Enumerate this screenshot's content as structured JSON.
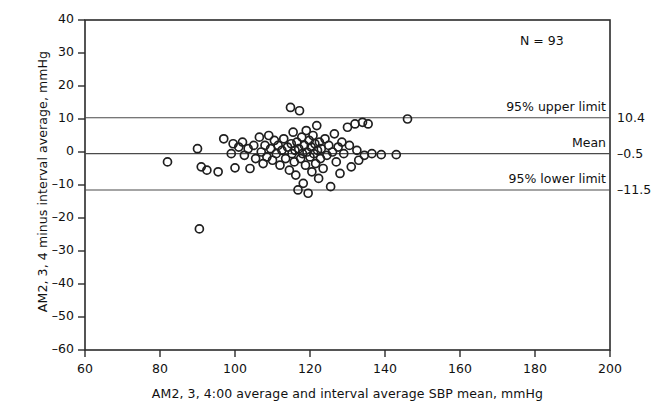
{
  "chart_data": {
    "type": "scatter",
    "title": "",
    "xlabel": "AM2, 3, 4:00 average and interval average SBP mean, mmHg",
    "ylabel": "AM2, 3, 4 minus interval average, mmHg",
    "xlim": [
      60,
      200
    ],
    "ylim": [
      -60,
      40
    ],
    "xticks": [
      60,
      80,
      100,
      120,
      140,
      160,
      180,
      200
    ],
    "yticks": [
      40,
      30,
      20,
      10,
      0,
      -10,
      -20,
      -30,
      -40,
      -50,
      -60
    ],
    "ytick_labels": [
      "40",
      "30",
      "20",
      "10",
      "0",
      "–10",
      "–20",
      "–30",
      "–40",
      "–50",
      "–60"
    ],
    "xtick_labels": [
      "60",
      "80",
      "100",
      "120",
      "140",
      "160",
      "180",
      "200"
    ],
    "grid": false,
    "legend_position": "none",
    "annotations": [
      {
        "name": "sample-size",
        "text": "N = 93"
      }
    ],
    "reference_lines": [
      {
        "name": "95% upper limit",
        "label": "95% upper limit",
        "value": 10.4,
        "value_label": "10.4"
      },
      {
        "name": "Mean",
        "label": "Mean",
        "value": -0.5,
        "value_label": "–0.5"
      },
      {
        "name": "95% lower limit",
        "label": "95% lower limit",
        "value": -11.5,
        "value_label": "–11.5"
      }
    ],
    "marker": {
      "style": "open-circle",
      "radius": 4.0,
      "edge_color": "#1f1f1f",
      "fill": "none"
    },
    "n_points": 93,
    "points": [
      [
        82.0,
        -3.0
      ],
      [
        90.5,
        -23.3
      ],
      [
        90.0,
        1.0
      ],
      [
        91.0,
        -4.5
      ],
      [
        92.5,
        -5.5
      ],
      [
        95.5,
        -6.0
      ],
      [
        97.0,
        4.0
      ],
      [
        99.0,
        -0.5
      ],
      [
        99.5,
        2.5
      ],
      [
        100.0,
        -4.8
      ],
      [
        101.0,
        1.5
      ],
      [
        102.0,
        3.0
      ],
      [
        102.5,
        -1.0
      ],
      [
        103.5,
        1.0
      ],
      [
        104.0,
        -5.0
      ],
      [
        105.0,
        2.0
      ],
      [
        105.5,
        -2.0
      ],
      [
        106.5,
        4.5
      ],
      [
        107.0,
        0.0
      ],
      [
        107.5,
        -3.5
      ],
      [
        108.0,
        2.0
      ],
      [
        108.5,
        -1.5
      ],
      [
        109.0,
        5.0
      ],
      [
        109.5,
        1.0
      ],
      [
        110.0,
        -2.5
      ],
      [
        110.5,
        3.5
      ],
      [
        111.0,
        -0.5
      ],
      [
        111.5,
        2.0
      ],
      [
        112.0,
        -4.0
      ],
      [
        112.5,
        0.5
      ],
      [
        113.0,
        4.0
      ],
      [
        113.5,
        -2.0
      ],
      [
        114.0,
        1.5
      ],
      [
        114.5,
        -5.5
      ],
      [
        114.8,
        13.5
      ],
      [
        115.0,
        2.5
      ],
      [
        115.2,
        -0.5
      ],
      [
        115.5,
        6.0
      ],
      [
        115.8,
        -3.0
      ],
      [
        116.0,
        0.5
      ],
      [
        116.2,
        -7.0
      ],
      [
        116.5,
        3.0
      ],
      [
        116.8,
        -11.5
      ],
      [
        117.0,
        1.0
      ],
      [
        117.2,
        12.5
      ],
      [
        117.5,
        -2.0
      ],
      [
        117.8,
        4.5
      ],
      [
        118.0,
        -0.5
      ],
      [
        118.2,
        -9.5
      ],
      [
        118.5,
        2.0
      ],
      [
        118.8,
        -4.0
      ],
      [
        119.0,
        6.5
      ],
      [
        119.2,
        0.0
      ],
      [
        119.5,
        -12.5
      ],
      [
        119.8,
        3.5
      ],
      [
        120.0,
        -1.5
      ],
      [
        120.3,
        1.5
      ],
      [
        120.5,
        -6.0
      ],
      [
        120.8,
        5.0
      ],
      [
        121.0,
        -0.5
      ],
      [
        121.3,
        2.5
      ],
      [
        121.5,
        -3.5
      ],
      [
        121.8,
        8.0
      ],
      [
        122.0,
        0.5
      ],
      [
        122.3,
        -8.0
      ],
      [
        122.5,
        3.0
      ],
      [
        122.8,
        -2.0
      ],
      [
        123.0,
        1.0
      ],
      [
        123.5,
        -5.0
      ],
      [
        124.0,
        4.0
      ],
      [
        124.5,
        -1.0
      ],
      [
        125.0,
        2.0
      ],
      [
        125.5,
        -10.5
      ],
      [
        126.0,
        0.0
      ],
      [
        126.5,
        5.5
      ],
      [
        127.0,
        -3.0
      ],
      [
        127.5,
        1.5
      ],
      [
        128.0,
        -6.5
      ],
      [
        128.5,
        3.0
      ],
      [
        129.0,
        -0.5
      ],
      [
        130.0,
        7.5
      ],
      [
        130.5,
        2.0
      ],
      [
        131.0,
        -4.5
      ],
      [
        132.0,
        8.5
      ],
      [
        132.5,
        0.5
      ],
      [
        133.0,
        -2.5
      ],
      [
        134.0,
        9.0
      ],
      [
        134.5,
        -1.0
      ],
      [
        135.5,
        8.5
      ],
      [
        136.5,
        -0.5
      ],
      [
        139.0,
        -0.8
      ],
      [
        143.0,
        -0.8
      ],
      [
        146.0,
        10.0
      ]
    ]
  }
}
